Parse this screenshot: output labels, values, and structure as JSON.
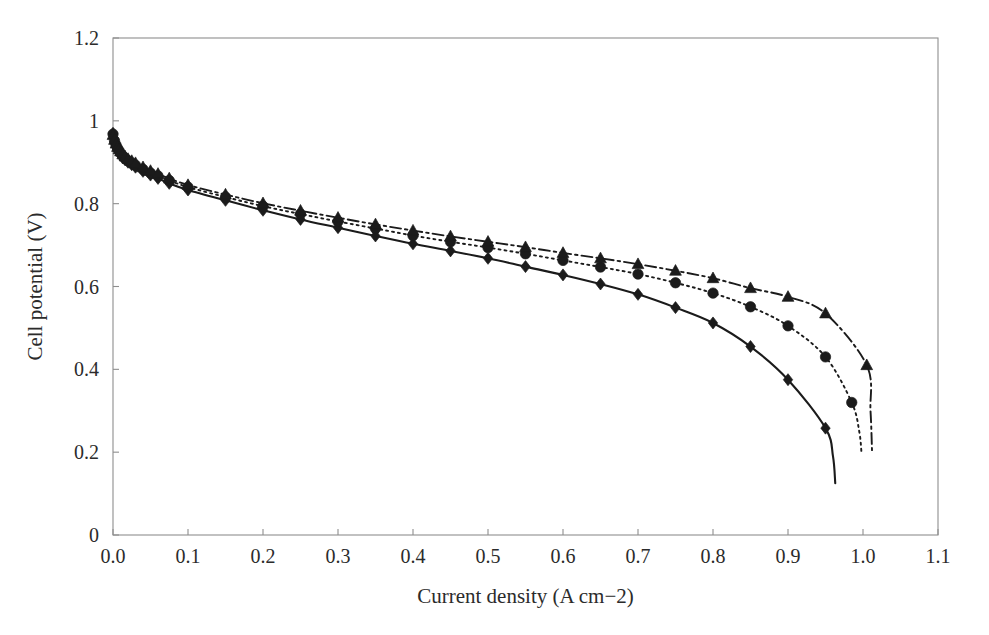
{
  "chart_data": {
    "type": "line",
    "title": "",
    "subtitle": "",
    "xlabel": "Current density (A cm−2)",
    "ylabel": "Cell potential (V)",
    "xlim": [
      0.0,
      1.1
    ],
    "ylim": [
      0.0,
      1.2
    ],
    "xticks": [
      0.0,
      0.1,
      0.2,
      0.3,
      0.4,
      0.5,
      0.6,
      0.7,
      0.8,
      0.9,
      1.0,
      1.1
    ],
    "xtick_labels": [
      "0.0",
      "0.1",
      "0.2",
      "0.3",
      "0.4",
      "0.5",
      "0.6",
      "0.7",
      "0.8",
      "0.9",
      "1.0",
      "1.1"
    ],
    "yticks": [
      0.0,
      0.2,
      0.4,
      0.6,
      0.8,
      1.0,
      1.2
    ],
    "ytick_labels": [
      "0",
      "0.2",
      "0.4",
      "0.6",
      "0.8",
      "1",
      "1.2"
    ],
    "grid": false,
    "legend": "none",
    "frame": "box",
    "series": [
      {
        "name": "series-diamond",
        "marker": "diamond",
        "linestyle": "solid",
        "color": "#1b1b1b",
        "points": [
          [
            0.0,
            0.97
          ],
          [
            0.002,
            0.95
          ],
          [
            0.004,
            0.94
          ],
          [
            0.006,
            0.931
          ],
          [
            0.008,
            0.925
          ],
          [
            0.01,
            0.919
          ],
          [
            0.013,
            0.912
          ],
          [
            0.016,
            0.906
          ],
          [
            0.02,
            0.9
          ],
          [
            0.025,
            0.894
          ],
          [
            0.03,
            0.888
          ],
          [
            0.04,
            0.878
          ],
          [
            0.05,
            0.869
          ],
          [
            0.06,
            0.861
          ],
          [
            0.075,
            0.849
          ],
          [
            0.1,
            0.833
          ],
          [
            0.15,
            0.808
          ],
          [
            0.2,
            0.784
          ],
          [
            0.25,
            0.762
          ],
          [
            0.3,
            0.742
          ],
          [
            0.35,
            0.722
          ],
          [
            0.4,
            0.703
          ],
          [
            0.45,
            0.686
          ],
          [
            0.5,
            0.668
          ],
          [
            0.55,
            0.648
          ],
          [
            0.6,
            0.628
          ],
          [
            0.65,
            0.606
          ],
          [
            0.7,
            0.581
          ],
          [
            0.75,
            0.549
          ],
          [
            0.8,
            0.512
          ],
          [
            0.85,
            0.455
          ],
          [
            0.9,
            0.375
          ],
          [
            0.95,
            0.258
          ],
          [
            0.96,
            0.19
          ],
          [
            0.963,
            0.125
          ]
        ]
      },
      {
        "name": "series-circle",
        "marker": "circle",
        "linestyle": "dotted",
        "color": "#1b1b1b",
        "points": [
          [
            0.0,
            0.968
          ],
          [
            0.002,
            0.952
          ],
          [
            0.004,
            0.942
          ],
          [
            0.006,
            0.934
          ],
          [
            0.008,
            0.928
          ],
          [
            0.01,
            0.922
          ],
          [
            0.013,
            0.915
          ],
          [
            0.016,
            0.909
          ],
          [
            0.02,
            0.904
          ],
          [
            0.025,
            0.898
          ],
          [
            0.03,
            0.893
          ],
          [
            0.04,
            0.883
          ],
          [
            0.05,
            0.874
          ],
          [
            0.06,
            0.867
          ],
          [
            0.075,
            0.856
          ],
          [
            0.1,
            0.84
          ],
          [
            0.15,
            0.816
          ],
          [
            0.2,
            0.794
          ],
          [
            0.25,
            0.775
          ],
          [
            0.3,
            0.757
          ],
          [
            0.35,
            0.74
          ],
          [
            0.4,
            0.723
          ],
          [
            0.45,
            0.708
          ],
          [
            0.5,
            0.694
          ],
          [
            0.55,
            0.679
          ],
          [
            0.6,
            0.663
          ],
          [
            0.65,
            0.647
          ],
          [
            0.7,
            0.63
          ],
          [
            0.75,
            0.609
          ],
          [
            0.8,
            0.584
          ],
          [
            0.85,
            0.551
          ],
          [
            0.9,
            0.505
          ],
          [
            0.95,
            0.43
          ],
          [
            0.985,
            0.32
          ],
          [
            0.995,
            0.25
          ],
          [
            0.998,
            0.198
          ]
        ]
      },
      {
        "name": "series-triangle",
        "marker": "triangle",
        "linestyle": "dashdot",
        "color": "#1b1b1b",
        "points": [
          [
            0.0,
            0.966
          ],
          [
            0.002,
            0.954
          ],
          [
            0.004,
            0.945
          ],
          [
            0.006,
            0.937
          ],
          [
            0.008,
            0.931
          ],
          [
            0.01,
            0.926
          ],
          [
            0.013,
            0.919
          ],
          [
            0.016,
            0.914
          ],
          [
            0.02,
            0.908
          ],
          [
            0.025,
            0.903
          ],
          [
            0.03,
            0.898
          ],
          [
            0.04,
            0.888
          ],
          [
            0.05,
            0.879
          ],
          [
            0.06,
            0.872
          ],
          [
            0.075,
            0.861
          ],
          [
            0.1,
            0.845
          ],
          [
            0.15,
            0.822
          ],
          [
            0.2,
            0.801
          ],
          [
            0.25,
            0.783
          ],
          [
            0.3,
            0.766
          ],
          [
            0.35,
            0.75
          ],
          [
            0.4,
            0.735
          ],
          [
            0.45,
            0.721
          ],
          [
            0.5,
            0.708
          ],
          [
            0.55,
            0.695
          ],
          [
            0.6,
            0.681
          ],
          [
            0.65,
            0.668
          ],
          [
            0.7,
            0.654
          ],
          [
            0.75,
            0.638
          ],
          [
            0.8,
            0.62
          ],
          [
            0.85,
            0.596
          ],
          [
            0.9,
            0.575
          ],
          [
            0.95,
            0.535
          ],
          [
            1.005,
            0.41
          ],
          [
            1.01,
            0.3
          ],
          [
            1.012,
            0.205
          ]
        ]
      }
    ]
  },
  "axes_geometry": {
    "left": 113,
    "right": 938,
    "top": 38,
    "bottom": 535
  }
}
